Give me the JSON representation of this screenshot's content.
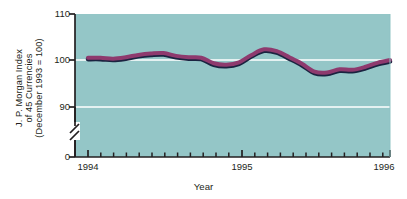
{
  "chart_data": {
    "type": "line",
    "title": "",
    "subtitle": "",
    "xlabel": "Year",
    "ylabel": "J. P. Morgan Index of 45 Currencies (December 1993 = 100)",
    "ylabel_lines": [
      "J. P. Morgan Index",
      "of 45 Currencies",
      "(December 1993 = 100)"
    ],
    "ylim": [
      0,
      110
    ],
    "y_axis_break": true,
    "y_break_between": [
      0,
      90
    ],
    "ytick_labels": [
      "110",
      "100",
      "90",
      "0"
    ],
    "ytick_values": [
      110,
      100,
      90,
      0
    ],
    "gridlines": [
      "100",
      "90"
    ],
    "grid_color": "#ffffff",
    "xlim": [
      "1994-01",
      "1996-01"
    ],
    "xtick_labels": [
      "1994",
      "1995",
      "1996"
    ],
    "xtick_values": [
      1994,
      1995,
      1996
    ],
    "minor_ticks": "monthly",
    "legend": null,
    "legend_position": "none",
    "plot_bgcolor": "#8fc3c4",
    "line_color": "#8e3a6e",
    "line_shadow_color": "#1b2340",
    "axis_color": "#231f20",
    "series": [
      {
        "name": "J. P. Morgan Index of 45 Currencies",
        "x": [
          "1994-01",
          "1994-02",
          "1994-03",
          "1994-04",
          "1994-05",
          "1994-06",
          "1994-07",
          "1994-08",
          "1994-09",
          "1994-10",
          "1994-11",
          "1994-12",
          "1995-01",
          "1995-02",
          "1995-03",
          "1995-04",
          "1995-05",
          "1995-06",
          "1995-07",
          "1995-08",
          "1995-09",
          "1995-10",
          "1995-11",
          "1995-12",
          "1996-01"
        ],
        "values": [
          100.6,
          100.6,
          100.4,
          100.7,
          101.2,
          101.5,
          101.6,
          101.0,
          100.7,
          100.6,
          99.4,
          99.1,
          99.6,
          101.2,
          102.4,
          102.0,
          100.7,
          99.3,
          97.6,
          97.4,
          98.1,
          98.0,
          98.6,
          99.5,
          100.1
        ]
      }
    ]
  },
  "axis": {
    "y_top_label": "110",
    "y_mid_label": "100",
    "y_low_label": "90",
    "y_zero_label": "0",
    "x_first": "1994",
    "x_second": "1995",
    "x_third": "1996",
    "x_title": "Year"
  }
}
